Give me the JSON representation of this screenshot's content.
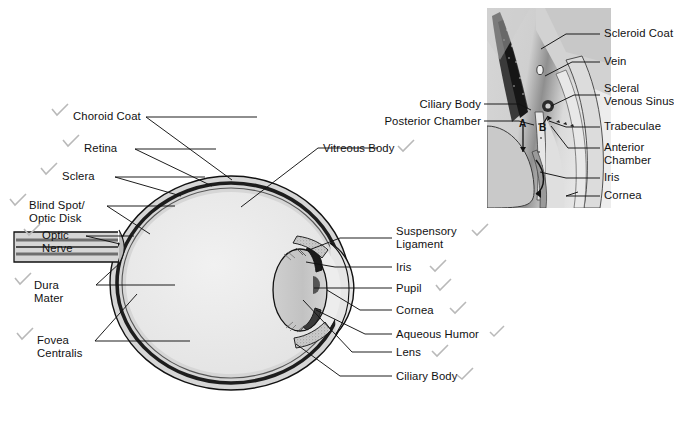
{
  "figure": {
    "background_color": "#ffffff",
    "line_color": "#111111",
    "checkmark_color": "#b9b9b9",
    "sclera_fill": "#d8d8d8",
    "choroid_fill": "#2b2b2b",
    "vitreous_fill": "#e9e9e9",
    "lens_fill": "#c6c6c6"
  },
  "main_diagram": {
    "name": "sagittal-section-of-eye",
    "left_labels": [
      {
        "id": "choroid-coat",
        "text": "Choroid Coat",
        "checked": true
      },
      {
        "id": "retina",
        "text": "Retina",
        "checked": true
      },
      {
        "id": "sclera",
        "text": "Sclera",
        "checked": true
      },
      {
        "id": "blind-spot-optic-disk",
        "text": "Blind Spot/\nOptic Disk",
        "checked": true
      },
      {
        "id": "optic-nerve",
        "text": "Optic\nNerve",
        "checked": true
      },
      {
        "id": "dura-mater",
        "text": "Dura\nMater",
        "checked": true
      },
      {
        "id": "fovea-centralis",
        "text": "Fovea\nCentralis",
        "checked": true
      }
    ],
    "right_labels": [
      {
        "id": "vitreous-body",
        "text": "Vitreous Body",
        "checked": true
      },
      {
        "id": "suspensory-ligament",
        "text": "Suspensory\nLigament",
        "checked": true
      },
      {
        "id": "iris",
        "text": "Iris",
        "checked": true
      },
      {
        "id": "pupil",
        "text": "Pupil",
        "checked": true
      },
      {
        "id": "cornea",
        "text": "Cornea",
        "checked": true
      },
      {
        "id": "aqueous-humor",
        "text": "Aqueous Humor",
        "checked": true
      },
      {
        "id": "lens",
        "text": "Lens",
        "checked": true
      },
      {
        "id": "ciliary-body",
        "text": "Ciliary Body",
        "checked": true
      }
    ]
  },
  "inset_diagram": {
    "name": "anterior-chamber-detail",
    "labels_right": [
      {
        "id": "scleroid-coat",
        "text": "Scleroid Coat"
      },
      {
        "id": "vein",
        "text": "Vein"
      },
      {
        "id": "scleral-venous-sinus",
        "text": "Scleral\nVenous Sinus"
      },
      {
        "id": "trabeculae",
        "text": "Trabeculae"
      },
      {
        "id": "anterior-chamber",
        "text": "Anterior\nChamber"
      },
      {
        "id": "iris",
        "text": "Iris"
      },
      {
        "id": "cornea",
        "text": "Cornea"
      }
    ],
    "labels_left": [
      {
        "id": "ciliary-body",
        "text": "Ciliary Body"
      },
      {
        "id": "posterior-chamber",
        "text": "Posterior Chamber"
      }
    ],
    "markers": [
      {
        "id": "marker-a",
        "text": "A"
      },
      {
        "id": "marker-b",
        "text": "B"
      }
    ]
  }
}
